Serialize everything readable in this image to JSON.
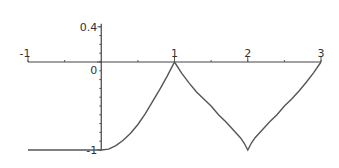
{
  "chart_data": {
    "type": "line",
    "title": "",
    "xlabel": "",
    "ylabel": "",
    "xlim": [
      -1,
      3
    ],
    "ylim": [
      -1,
      0.4
    ],
    "grid": false,
    "x_ticks": [
      {
        "value": -1,
        "label": "-1"
      },
      {
        "value": 1,
        "label": "1"
      },
      {
        "value": 2,
        "label": "2"
      },
      {
        "value": 3,
        "label": "3"
      }
    ],
    "y_ticks": [
      {
        "value": 0.4,
        "label": "0.4"
      },
      {
        "value": 0,
        "label": "0"
      },
      {
        "value": -1,
        "label": "-1"
      }
    ],
    "x_minor_step": 0.2,
    "y_minor_step": 0.1,
    "series": [
      {
        "name": "f(x)",
        "x": [
          -1,
          -0.5,
          0,
          0.1,
          0.2,
          0.3,
          0.4,
          0.5,
          0.6,
          0.7,
          0.8,
          0.9,
          1,
          1.1,
          1.2,
          1.3,
          1.4,
          1.5,
          1.6,
          1.7,
          1.8,
          1.9,
          1.95,
          2,
          2.05,
          2.1,
          2.2,
          2.3,
          2.4,
          2.5,
          2.6,
          2.7,
          2.8,
          2.9,
          3
        ],
        "y": [
          -1,
          -1,
          -1,
          -0.99,
          -0.95,
          -0.89,
          -0.81,
          -0.71,
          -0.59,
          -0.45,
          -0.31,
          -0.16,
          0,
          -0.13,
          -0.24,
          -0.34,
          -0.42,
          -0.5,
          -0.6,
          -0.68,
          -0.77,
          -0.86,
          -0.92,
          -1,
          -0.92,
          -0.86,
          -0.77,
          -0.68,
          -0.6,
          -0.5,
          -0.42,
          -0.33,
          -0.23,
          -0.12,
          0
        ]
      }
    ]
  }
}
